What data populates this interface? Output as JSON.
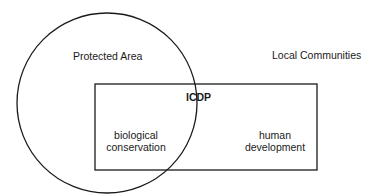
{
  "diagram": {
    "circle": {
      "label": "Protected Area",
      "cx": 107,
      "cy": 103,
      "r": 90
    },
    "outside_label": "Local Communities",
    "rectangle": {
      "label": "ICDP",
      "x": 95,
      "y": 84,
      "width": 222,
      "height": 86
    },
    "left_region": {
      "line1": "biological",
      "line2": "conservation"
    },
    "right_region": {
      "line1": "human",
      "line2": "development"
    },
    "stroke_color": "#1a1a1a"
  }
}
